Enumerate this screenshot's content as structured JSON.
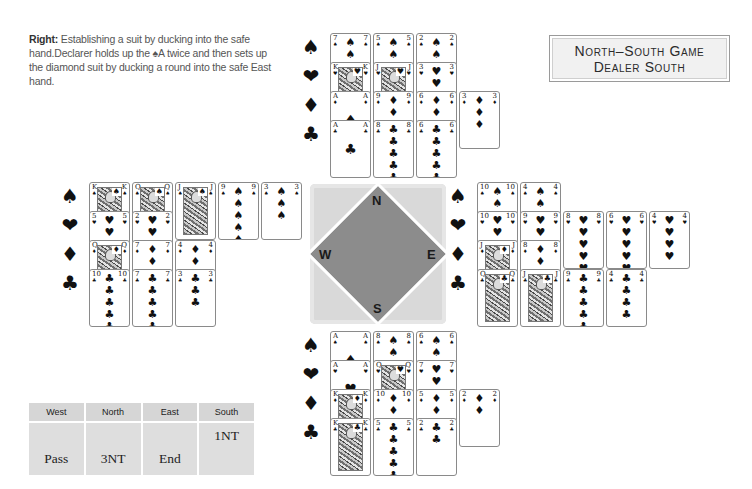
{
  "caption": {
    "lead": "Right:",
    "text": "Establishing a suit by ducking into the safe hand.Declarer holds up the ♠A twice and then sets up the diamond suit by ducking a round into the safe East hand."
  },
  "title_box": {
    "line1": "North–South Game",
    "line2": "Dealer South"
  },
  "suit_symbols": {
    "spades": "♠",
    "hearts": "❤",
    "diamonds": "♦",
    "clubs": "♣"
  },
  "compass": {
    "north": "N",
    "south": "S",
    "east": "E",
    "west": "W",
    "colors": {
      "background": "#d9d9d9",
      "diamond": "#8c8c8c"
    }
  },
  "hands": {
    "north": {
      "spades": [
        "7",
        "5",
        "2"
      ],
      "hearts": [
        "K",
        "J",
        "3"
      ],
      "diamonds": [
        "A",
        "9",
        "6",
        "3"
      ],
      "clubs": [
        "A",
        "8",
        "6"
      ]
    },
    "west": {
      "spades": [
        "K",
        "Q",
        "J",
        "9",
        "3"
      ],
      "hearts": [
        "5",
        "2"
      ],
      "diamonds": [
        "Q",
        "7",
        "4"
      ],
      "clubs": [
        "10",
        "7",
        "3"
      ]
    },
    "east": {
      "spades": [
        "10",
        "4"
      ],
      "hearts": [
        "10",
        "9",
        "8",
        "6",
        "4"
      ],
      "diamonds": [
        "J",
        "8"
      ],
      "clubs": [
        "Q",
        "J",
        "9",
        "4"
      ]
    },
    "south": {
      "spades": [
        "A",
        "8",
        "6"
      ],
      "hearts": [
        "A",
        "Q",
        "7"
      ],
      "diamonds": [
        "K",
        "10",
        "5",
        "2"
      ],
      "clubs": [
        "K",
        "5",
        "2"
      ]
    }
  },
  "bidding": {
    "headers": [
      "West",
      "North",
      "East",
      "South"
    ],
    "rows": [
      [
        "",
        "",
        "",
        "1NT"
      ],
      [
        "Pass",
        "3NT",
        "End",
        ""
      ]
    ]
  }
}
